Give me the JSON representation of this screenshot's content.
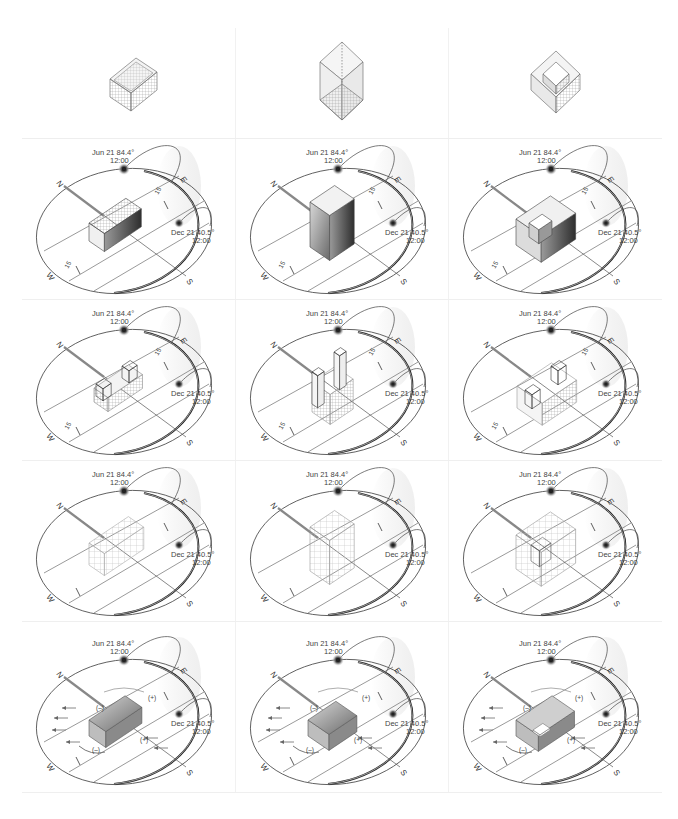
{
  "figure": {
    "columns": [
      {
        "typology": "bar",
        "top_icon": "bar-massing"
      },
      {
        "typology": "tower",
        "top_icon": "tower-massing"
      },
      {
        "typology": "courtyard",
        "top_icon": "courtyard-massing"
      }
    ],
    "rows": [
      {
        "id": "massing",
        "kind": "isometric-massing"
      },
      {
        "id": "solar-solid",
        "kind": "sun-path",
        "variant": "solid-mass"
      },
      {
        "id": "solar-split",
        "kind": "sun-path",
        "variant": "split-blocks"
      },
      {
        "id": "solar-grid",
        "kind": "sun-path",
        "variant": "grid-frame"
      },
      {
        "id": "wind",
        "kind": "sun-path",
        "variant": "wind-pressure"
      }
    ]
  },
  "sunpath": {
    "summer": {
      "label": "Jun 21 84.4°",
      "time": "12:00"
    },
    "winter": {
      "label": "Dec 21 40.5°",
      "time": "12:00"
    },
    "compass": {
      "n": "N",
      "e": "E",
      "s": "S",
      "w": "W"
    },
    "dimension_upper": "15",
    "dimension_lower": "15"
  },
  "wind": {
    "positive": "(+)",
    "negative": "(–)"
  },
  "colors": {
    "line": "#333333",
    "ring_dark": "#222222",
    "mass_light": "#e6e6e6",
    "mass_dark": "#555555",
    "sun": "#444444"
  }
}
